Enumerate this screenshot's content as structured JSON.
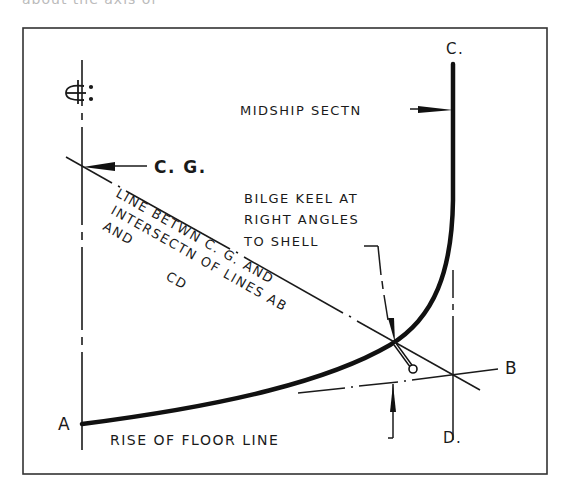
{
  "top_cutoff_text": "about the axis of",
  "diagram": {
    "centerline_symbol": "CL:",
    "points": {
      "a": "A",
      "b": "B",
      "c": "C.",
      "d": "D."
    },
    "labels": {
      "cg": "C. G.",
      "midship": "MIDSHIP SECTN",
      "bilge_keel_line1": "BILGE KEEL AT",
      "bilge_keel_line2": "RIGHT ANGLES",
      "bilge_keel_line3": "TO SHELL",
      "diag_line1": "LINE BETWN C. G. AND",
      "diag_line2": "INTERSECTN OF LINES AB",
      "diag_line3": "AND",
      "diag_line4": "CD",
      "rise_of_floor": "RISE OF FLOOR LINE"
    },
    "colors": {
      "ink": "#1a1a1a",
      "frame": "#333333",
      "background": "#ffffff"
    }
  }
}
